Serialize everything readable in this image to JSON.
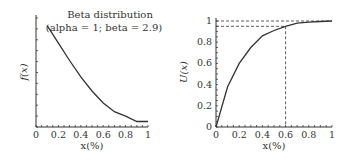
{
  "chart_data": [
    {
      "type": "line",
      "title": "Beta distribution",
      "subtitle": "(alpha = 1; beta = 2.9)",
      "xlabel": "x(%)",
      "ylabel": "f(x)",
      "xlim": [
        0,
        1
      ],
      "x_ticks": [
        "0",
        "0.2",
        "0.4",
        "0.6",
        "0.8",
        "1"
      ],
      "y_ticks": [],
      "grid": false,
      "series": [
        {
          "name": "f(x)",
          "x": [
            0.1,
            0.2,
            0.3,
            0.4,
            0.5,
            0.6,
            0.7,
            0.8,
            0.9,
            1.0
          ],
          "values": [
            0.93,
            0.77,
            0.61,
            0.46,
            0.33,
            0.22,
            0.14,
            0.1,
            0.05,
            0.05
          ]
        }
      ]
    },
    {
      "type": "line",
      "title": "",
      "xlabel": "x(%)",
      "ylabel": "U(x)",
      "xlim": [
        0,
        1
      ],
      "ylim": [
        0,
        1
      ],
      "x_ticks": [
        "0",
        "0.2",
        "0.4",
        "0.6",
        "0.8",
        "1"
      ],
      "y_ticks": [
        "0",
        "0.2",
        "0.4",
        "0.6",
        "0.8",
        "1"
      ],
      "grid": false,
      "series": [
        {
          "name": "U(x)",
          "x": [
            0,
            0.1,
            0.2,
            0.3,
            0.4,
            0.5,
            0.6,
            0.7,
            0.8,
            0.9,
            1.0
          ],
          "values": [
            0,
            0.38,
            0.6,
            0.75,
            0.86,
            0.91,
            0.95,
            0.98,
            0.99,
            0.995,
            1.0
          ]
        }
      ],
      "annotations": [
        {
          "type": "dashed-hline",
          "y": 1.0
        },
        {
          "type": "dashed-hline",
          "y": 0.95,
          "x_end": 0.6
        },
        {
          "type": "dashed-vline",
          "x": 0.6,
          "y_end": 0.95
        }
      ]
    }
  ]
}
